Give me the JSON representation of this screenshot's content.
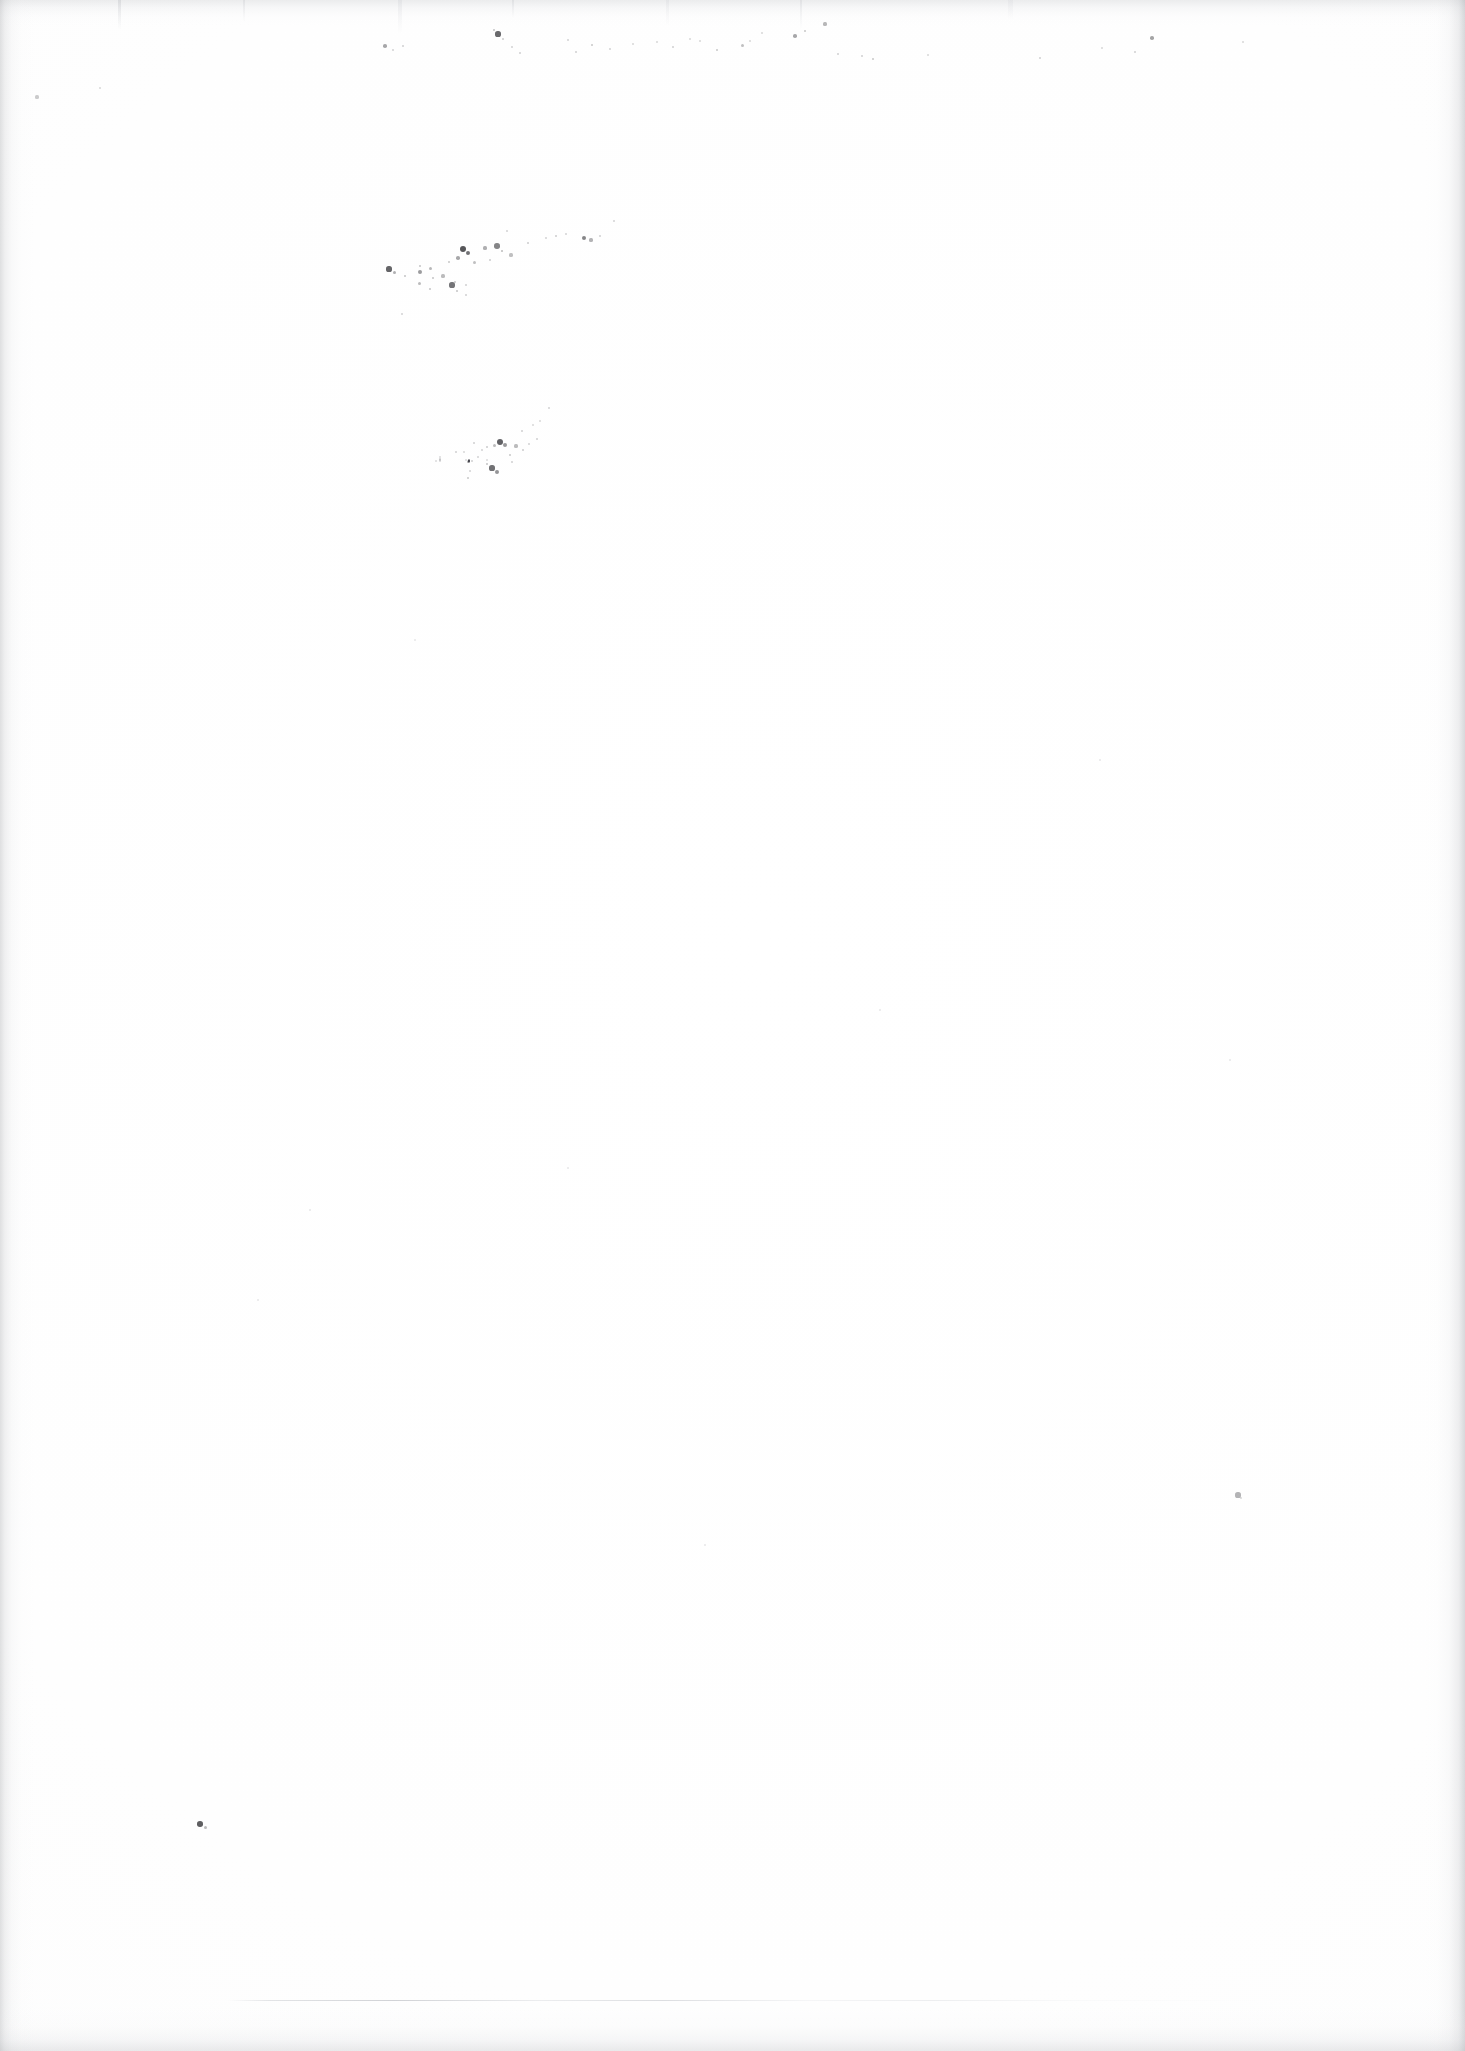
{
  "document": {
    "kind": "scanned-page",
    "title": "Scanned blank page",
    "page_width": 1465,
    "page_height": 2051,
    "visible_text": "",
    "text_content_present": false,
    "description": "A blank scanned sheet of paper. No text, headings, figures, tables or captions are rendered anywhere on the page. The only visible marks are scanner artifacts: faint gray shading along the page edges, vertical streaks across the top margin, scattered dark dust specks in the upper-left quadrant, two isolated specks, and a very faint broken horizontal rule near the bottom."
  },
  "colors": {
    "background": "#fefefe",
    "paper_white": "#ffffff",
    "paper_shade": "#fbfbfb",
    "edge_shadow": "#a8aab0",
    "speck_dark": "#3a3a3e",
    "speck_mid": "#84868c",
    "speck_light": "#c6c8cc",
    "rule_line": "#bec0c5"
  },
  "artifacts": {
    "edges": {
      "left_band_width": 34,
      "right_band_width": 40,
      "top_band_height": 26,
      "bottom_band_height": 44
    },
    "faint_rule": {
      "label": "faint broken horizontal rule",
      "x": 228,
      "y": 2000,
      "width": 1035
    },
    "speck_clusters": [
      {
        "label": "upper-left diagonal speck trail (primary)",
        "x": 420,
        "y": 220,
        "width": 170,
        "height": 120
      },
      {
        "label": "upper-left diagonal speck trail (secondary)",
        "x": 440,
        "y": 390,
        "width": 170,
        "height": 120
      },
      {
        "label": "top margin scattered specks",
        "x": 350,
        "y": 12,
        "width": 520,
        "height": 60
      }
    ],
    "isolated_specks": [
      {
        "label": "lower-left dark speck",
        "x": 202,
        "y": 1825,
        "size": 5,
        "tone": "#3a3a3e"
      },
      {
        "label": "right-of-center gray speck",
        "x": 1238,
        "y": 1495,
        "size": 5,
        "tone": "#9a9ca2"
      }
    ],
    "specks": [
      {
        "x": 463,
        "y": 249,
        "r": 3.2,
        "o": 0.86
      },
      {
        "x": 468,
        "y": 253,
        "r": 2.4,
        "o": 0.72
      },
      {
        "x": 485,
        "y": 248,
        "r": 1.6,
        "o": 0.4
      },
      {
        "x": 497,
        "y": 246,
        "r": 2.8,
        "o": 0.62
      },
      {
        "x": 502,
        "y": 251,
        "r": 1.4,
        "o": 0.34
      },
      {
        "x": 420,
        "y": 266,
        "r": 1.2,
        "o": 0.3
      },
      {
        "x": 430,
        "y": 268,
        "r": 1.5,
        "o": 0.36
      },
      {
        "x": 449,
        "y": 262,
        "r": 1.3,
        "o": 0.28
      },
      {
        "x": 458,
        "y": 258,
        "r": 1.8,
        "o": 0.44
      },
      {
        "x": 474,
        "y": 262,
        "r": 1.5,
        "o": 0.32
      },
      {
        "x": 490,
        "y": 260,
        "r": 1.2,
        "o": 0.26
      },
      {
        "x": 420,
        "y": 272,
        "r": 2.0,
        "o": 0.5
      },
      {
        "x": 433,
        "y": 278,
        "r": 1.4,
        "o": 0.3
      },
      {
        "x": 443,
        "y": 276,
        "r": 1.6,
        "o": 0.34
      },
      {
        "x": 455,
        "y": 282,
        "r": 1.3,
        "o": 0.28
      },
      {
        "x": 466,
        "y": 285,
        "r": 1.2,
        "o": 0.24
      },
      {
        "x": 389,
        "y": 269,
        "r": 2.6,
        "o": 0.78
      },
      {
        "x": 394,
        "y": 272,
        "r": 1.5,
        "o": 0.4
      },
      {
        "x": 405,
        "y": 276,
        "r": 1.3,
        "o": 0.3
      },
      {
        "x": 419,
        "y": 283,
        "r": 1.5,
        "o": 0.34
      },
      {
        "x": 430,
        "y": 289,
        "r": 1.4,
        "o": 0.3
      },
      {
        "x": 452,
        "y": 285,
        "r": 2.6,
        "o": 0.7
      },
      {
        "x": 457,
        "y": 291,
        "r": 1.4,
        "o": 0.3
      },
      {
        "x": 466,
        "y": 295,
        "r": 1.2,
        "o": 0.24
      },
      {
        "x": 511,
        "y": 255,
        "r": 1.6,
        "o": 0.32
      },
      {
        "x": 528,
        "y": 243,
        "r": 1.3,
        "o": 0.26
      },
      {
        "x": 546,
        "y": 238,
        "r": 1.2,
        "o": 0.22
      },
      {
        "x": 556,
        "y": 236,
        "r": 1.4,
        "o": 0.26
      },
      {
        "x": 566,
        "y": 234,
        "r": 1.2,
        "o": 0.22
      },
      {
        "x": 584,
        "y": 238,
        "r": 2.4,
        "o": 0.62
      },
      {
        "x": 591,
        "y": 240,
        "r": 1.6,
        "o": 0.38
      },
      {
        "x": 600,
        "y": 236,
        "r": 1.3,
        "o": 0.24
      },
      {
        "x": 614,
        "y": 221,
        "r": 1.2,
        "o": 0.22
      },
      {
        "x": 507,
        "y": 231,
        "r": 1.3,
        "o": 0.22
      },
      {
        "x": 402,
        "y": 314,
        "r": 1.2,
        "o": 0.22
      },
      {
        "x": 500,
        "y": 442,
        "r": 3.0,
        "o": 0.8
      },
      {
        "x": 505,
        "y": 445,
        "r": 2.0,
        "o": 0.52
      },
      {
        "x": 494,
        "y": 445,
        "r": 1.5,
        "o": 0.34
      },
      {
        "x": 487,
        "y": 447,
        "r": 1.3,
        "o": 0.26
      },
      {
        "x": 516,
        "y": 446,
        "r": 1.6,
        "o": 0.34
      },
      {
        "x": 523,
        "y": 450,
        "r": 1.3,
        "o": 0.26
      },
      {
        "x": 510,
        "y": 455,
        "r": 1.4,
        "o": 0.28
      },
      {
        "x": 512,
        "y": 462,
        "r": 1.3,
        "o": 0.24
      },
      {
        "x": 522,
        "y": 431,
        "r": 1.3,
        "o": 0.24
      },
      {
        "x": 533,
        "y": 425,
        "r": 1.2,
        "o": 0.2
      },
      {
        "x": 540,
        "y": 421,
        "r": 1.2,
        "o": 0.2
      },
      {
        "x": 549,
        "y": 408,
        "r": 1.3,
        "o": 0.22
      },
      {
        "x": 537,
        "y": 439,
        "r": 1.3,
        "o": 0.24
      },
      {
        "x": 529,
        "y": 444,
        "r": 1.2,
        "o": 0.22
      },
      {
        "x": 474,
        "y": 443,
        "r": 1.3,
        "o": 0.24
      },
      {
        "x": 478,
        "y": 457,
        "r": 1.2,
        "o": 0.22
      },
      {
        "x": 492,
        "y": 468,
        "r": 2.6,
        "o": 0.72
      },
      {
        "x": 497,
        "y": 472,
        "r": 2.0,
        "o": 0.54
      },
      {
        "x": 487,
        "y": 464,
        "r": 1.4,
        "o": 0.3
      },
      {
        "x": 482,
        "y": 450,
        "r": 1.2,
        "o": 0.22
      },
      {
        "x": 456,
        "y": 452,
        "r": 1.3,
        "o": 0.24
      },
      {
        "x": 464,
        "y": 452,
        "r": 1.2,
        "o": 0.2
      },
      {
        "x": 472,
        "y": 461,
        "r": 1.3,
        "o": 0.24
      },
      {
        "x": 470,
        "y": 471,
        "r": 1.2,
        "o": 0.22
      },
      {
        "x": 468,
        "y": 478,
        "r": 1.4,
        "o": 0.28
      },
      {
        "x": 468,
        "y": 462,
        "r": 1.2,
        "o": 0.2
      },
      {
        "x": 469,
        "y": 460,
        "r": 1.2,
        "o": 0.2
      },
      {
        "x": 469,
        "y": 460,
        "r": 1.0,
        "o": 0.18
      },
      {
        "x": 469,
        "y": 460,
        "r": 1.0,
        "o": 0.18
      },
      {
        "x": 468,
        "y": 461,
        "r": 1.0,
        "o": 0.18
      },
      {
        "x": 469,
        "y": 460,
        "r": 1.0,
        "o": 0.18
      },
      {
        "x": 440,
        "y": 459,
        "r": 1.3,
        "o": 0.22
      },
      {
        "x": 440,
        "y": 457,
        "r": 1.1,
        "o": 0.18
      },
      {
        "x": 469,
        "y": 461,
        "r": 1.0,
        "o": 0.18
      },
      {
        "x": 469,
        "y": 461,
        "r": 1.0,
        "o": 0.18
      },
      {
        "x": 487,
        "y": 460,
        "r": 1.0,
        "o": 0.18
      },
      {
        "x": 469,
        "y": 462,
        "r": 1.0,
        "o": 0.18
      },
      {
        "x": 440,
        "y": 460,
        "r": 1.0,
        "o": 0.18
      },
      {
        "x": 466,
        "y": 460,
        "r": 1.0,
        "o": 0.18
      },
      {
        "x": 440,
        "y": 461,
        "r": 1.0,
        "o": 0.18
      },
      {
        "x": 436,
        "y": 461,
        "r": 1.0,
        "o": 0.18
      },
      {
        "x": 469,
        "y": 461,
        "r": 1.0,
        "o": 0.18
      },
      {
        "x": 469,
        "y": 461,
        "r": 1.0,
        "o": 0.18
      },
      {
        "x": 469,
        "y": 461,
        "r": 1.0,
        "o": 0.18
      },
      {
        "x": 469,
        "y": 462,
        "r": 1.0,
        "o": 0.18
      },
      {
        "x": 468,
        "y": 462,
        "r": 1.0,
        "o": 0.18
      },
      {
        "x": 469,
        "y": 462,
        "r": 1.0,
        "o": 0.18
      },
      {
        "x": 469,
        "y": 461,
        "r": 1.0,
        "o": 0.18
      },
      {
        "x": 469,
        "y": 461,
        "r": 1.0,
        "o": 0.18
      },
      {
        "x": 469,
        "y": 461,
        "r": 1.0,
        "o": 0.18
      },
      {
        "x": 469,
        "y": 461,
        "r": 1.0,
        "o": 0.18
      },
      {
        "x": 469,
        "y": 461,
        "r": 1.0,
        "o": 0.18
      },
      {
        "x": 498,
        "y": 34,
        "r": 2.6,
        "o": 0.76
      },
      {
        "x": 494,
        "y": 30,
        "r": 1.4,
        "o": 0.3
      },
      {
        "x": 503,
        "y": 39,
        "r": 1.3,
        "o": 0.26
      },
      {
        "x": 385,
        "y": 46,
        "r": 1.8,
        "o": 0.44
      },
      {
        "x": 393,
        "y": 50,
        "r": 1.2,
        "o": 0.22
      },
      {
        "x": 403,
        "y": 46,
        "r": 1.3,
        "o": 0.24
      },
      {
        "x": 512,
        "y": 47,
        "r": 1.2,
        "o": 0.22
      },
      {
        "x": 520,
        "y": 53,
        "r": 1.3,
        "o": 0.24
      },
      {
        "x": 568,
        "y": 40,
        "r": 1.2,
        "o": 0.22
      },
      {
        "x": 576,
        "y": 52,
        "r": 1.3,
        "o": 0.24
      },
      {
        "x": 592,
        "y": 45,
        "r": 1.4,
        "o": 0.28
      },
      {
        "x": 610,
        "y": 49,
        "r": 1.2,
        "o": 0.22
      },
      {
        "x": 633,
        "y": 44,
        "r": 1.2,
        "o": 0.2
      },
      {
        "x": 657,
        "y": 42,
        "r": 1.2,
        "o": 0.2
      },
      {
        "x": 673,
        "y": 47,
        "r": 1.3,
        "o": 0.24
      },
      {
        "x": 690,
        "y": 39,
        "r": 1.2,
        "o": 0.2
      },
      {
        "x": 700,
        "y": 41,
        "r": 1.2,
        "o": 0.2
      },
      {
        "x": 717,
        "y": 50,
        "r": 1.4,
        "o": 0.28
      },
      {
        "x": 742,
        "y": 45,
        "r": 1.5,
        "o": 0.32
      },
      {
        "x": 750,
        "y": 41,
        "r": 1.2,
        "o": 0.2
      },
      {
        "x": 762,
        "y": 33,
        "r": 1.2,
        "o": 0.2
      },
      {
        "x": 795,
        "y": 36,
        "r": 1.8,
        "o": 0.44
      },
      {
        "x": 805,
        "y": 31,
        "r": 1.4,
        "o": 0.28
      },
      {
        "x": 825,
        "y": 24,
        "r": 1.6,
        "o": 0.36
      },
      {
        "x": 838,
        "y": 54,
        "r": 1.3,
        "o": 0.24
      },
      {
        "x": 862,
        "y": 56,
        "r": 1.3,
        "o": 0.24
      },
      {
        "x": 873,
        "y": 59,
        "r": 1.4,
        "o": 0.28
      },
      {
        "x": 928,
        "y": 55,
        "r": 1.2,
        "o": 0.2
      },
      {
        "x": 1040,
        "y": 58,
        "r": 1.3,
        "o": 0.24
      },
      {
        "x": 1102,
        "y": 48,
        "r": 1.2,
        "o": 0.2
      },
      {
        "x": 1135,
        "y": 52,
        "r": 1.3,
        "o": 0.24
      },
      {
        "x": 1152,
        "y": 38,
        "r": 1.8,
        "o": 0.46
      },
      {
        "x": 1243,
        "y": 42,
        "r": 1.2,
        "o": 0.2
      },
      {
        "x": 100,
        "y": 88,
        "r": 1.4,
        "o": 0.2
      },
      {
        "x": 37,
        "y": 97,
        "r": 1.6,
        "o": 0.26
      },
      {
        "x": 200,
        "y": 1824,
        "r": 2.8,
        "o": 0.82
      },
      {
        "x": 205,
        "y": 1827,
        "r": 1.5,
        "o": 0.34
      },
      {
        "x": 1238,
        "y": 1495,
        "r": 2.6,
        "o": 0.38
      },
      {
        "x": 1241,
        "y": 1498,
        "r": 1.4,
        "o": 0.2
      },
      {
        "x": 310,
        "y": 1210,
        "r": 1.2,
        "o": 0.12
      },
      {
        "x": 568,
        "y": 1168,
        "r": 1.2,
        "o": 0.12
      },
      {
        "x": 880,
        "y": 1010,
        "r": 1.2,
        "o": 0.12
      },
      {
        "x": 1230,
        "y": 1060,
        "r": 1.2,
        "o": 0.12
      },
      {
        "x": 705,
        "y": 1545,
        "r": 1.2,
        "o": 0.12
      },
      {
        "x": 258,
        "y": 1300,
        "r": 1.2,
        "o": 0.12
      },
      {
        "x": 1100,
        "y": 760,
        "r": 1.2,
        "o": 0.12
      },
      {
        "x": 415,
        "y": 640,
        "r": 1.2,
        "o": 0.12
      }
    ]
  }
}
